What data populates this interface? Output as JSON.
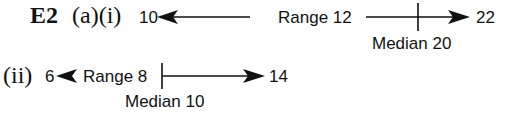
{
  "exercise": {
    "label": "E2",
    "part_a_i": "(a)(i)",
    "part_a_ii": "(ii)"
  },
  "diagram_i": {
    "min_label": "10",
    "max_label": "22",
    "range_label": "Range 12",
    "median_label": "Median 20",
    "min": 10,
    "max": 22,
    "range": 12,
    "median": 20
  },
  "diagram_ii": {
    "min_label": "6",
    "max_label": "14",
    "range_label": "Range 8",
    "median_label": "Median 10",
    "min": 6,
    "max": 14,
    "range": 8,
    "median": 10
  },
  "colors": {
    "ink": "#111111",
    "background": "#ffffff"
  }
}
